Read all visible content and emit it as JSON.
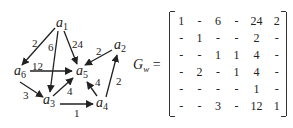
{
  "graph": {
    "nodes": [
      {
        "id": "a1",
        "label": "a",
        "sub": "1",
        "x": 58,
        "y": 25
      },
      {
        "id": "a2",
        "label": "a",
        "sub": "2",
        "x": 116,
        "y": 47
      },
      {
        "id": "a5",
        "label": "a",
        "sub": "5",
        "x": 78,
        "y": 75
      },
      {
        "id": "a6",
        "label": "a",
        "sub": "6",
        "x": 15,
        "y": 75
      },
      {
        "id": "a3",
        "label": "a",
        "sub": "3",
        "x": 45,
        "y": 104
      },
      {
        "id": "a4",
        "label": "a",
        "sub": "4",
        "x": 98,
        "y": 104
      }
    ],
    "edges": [
      {
        "from": "a1",
        "to": "a6",
        "weight": "2"
      },
      {
        "from": "a1",
        "to": "a3",
        "weight": "6"
      },
      {
        "from": "a1",
        "to": "a5",
        "weight": "24"
      },
      {
        "from": "a2",
        "to": "a5",
        "weight": "2"
      },
      {
        "from": "a6",
        "to": "a5",
        "weight": "12"
      },
      {
        "from": "a6",
        "to": "a3",
        "weight": "3"
      },
      {
        "from": "a3",
        "to": "a5",
        "weight": "4"
      },
      {
        "from": "a3",
        "to": "a4",
        "weight": "1"
      },
      {
        "from": "a4",
        "to": "a5",
        "weight": "4"
      },
      {
        "from": "a4",
        "to": "a2",
        "weight": "2"
      }
    ]
  },
  "matrix": {
    "name": "G",
    "subscript": "w",
    "equals": "=",
    "rows": [
      [
        "1",
        "-",
        "6",
        "-",
        "24",
        "2"
      ],
      [
        "-",
        "1",
        "-",
        "-",
        "2",
        "-"
      ],
      [
        "-",
        "-",
        "1",
        "1",
        "4",
        "-"
      ],
      [
        "-",
        "2",
        "-",
        "1",
        "4",
        "-"
      ],
      [
        "-",
        "-",
        "-",
        "-",
        "1",
        "-"
      ],
      [
        "-",
        "-",
        "3",
        "-",
        "12",
        "1"
      ]
    ]
  }
}
